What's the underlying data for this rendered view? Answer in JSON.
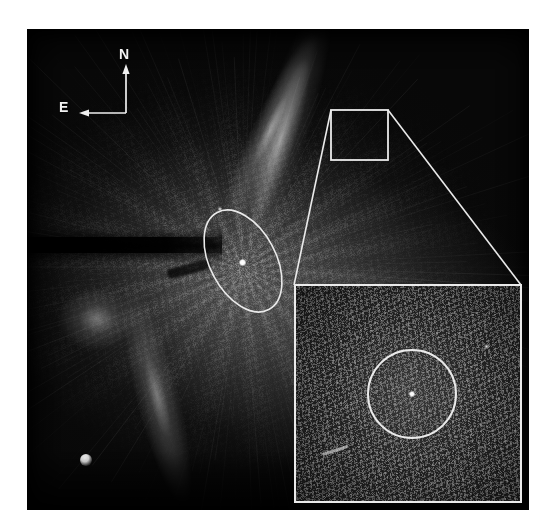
{
  "figure": {
    "type": "astronomical-coronagraph-image",
    "caption_absent": true,
    "background_color": "#ffffff",
    "plate_color": "#080808",
    "annotation_color": "#eaeaea"
  },
  "compass": {
    "north_label": "N",
    "east_label": "E",
    "north_arrow_direction": "up",
    "east_arrow_direction": "left",
    "origin_x": 99,
    "origin_y": 103,
    "stem_length_px": 45
  },
  "main_image": {
    "frame": {
      "x": 27,
      "y": 29,
      "width": 502,
      "height": 481
    },
    "features": [
      {
        "name": "central-point-source",
        "kind": "point",
        "x": 215,
        "y": 233,
        "brightness": "bright"
      },
      {
        "name": "ne-bright-arc",
        "kind": "diffuse-filament",
        "position": "upper-right-of-center"
      },
      {
        "name": "sw-bright-arc",
        "kind": "diffuse-filament",
        "position": "lower-left-of-center"
      },
      {
        "name": "west-bright-blob",
        "kind": "diffuse-knot",
        "position": "mid-left"
      },
      {
        "name": "occulting-bar",
        "kind": "mask",
        "orientation": "horizontal",
        "y": 216
      },
      {
        "name": "dark-streak",
        "kind": "mask-artifact",
        "orientation": "diagonal"
      },
      {
        "name": "sw-bright-point",
        "kind": "point",
        "x": 86,
        "y": 460
      },
      {
        "name": "faint-star",
        "kind": "point",
        "x": 218,
        "y": 209
      }
    ]
  },
  "overlays": {
    "ellipse": {
      "label": "companion-search-ellipse",
      "center_x": 216,
      "center_y": 232,
      "radius_x": 33,
      "radius_y": 55,
      "rotation_deg": -28,
      "stroke": "#eaeaea",
      "stroke_width": 1.6
    },
    "zoom_box": {
      "label": "zoom-source-box",
      "x": 304,
      "y": 81,
      "width": 57,
      "height": 50,
      "stroke": "#eaeaea",
      "stroke_width": 1.8
    },
    "zoom_lines": [
      {
        "label": "zoom-leader-left",
        "from_x": 304,
        "from_y": 81,
        "to_x": 267,
        "to_y": 255
      },
      {
        "label": "zoom-leader-right",
        "from_x": 361,
        "from_y": 81,
        "to_x": 495,
        "to_y": 255
      }
    ]
  },
  "inset": {
    "label": "magnified-detail-inset",
    "frame": {
      "x": 294,
      "y": 284,
      "width": 228,
      "height": 219
    },
    "border_color": "#eaeaea",
    "circle": {
      "label": "companion-marker-circle",
      "center_x": 116,
      "center_y": 108,
      "radius": 44,
      "stroke": "#eaeaea",
      "stroke_width": 2.0
    },
    "features": [
      {
        "name": "inset-point-source",
        "kind": "point",
        "x": 116,
        "y": 108,
        "brightness": "bright"
      },
      {
        "name": "inset-faint-star",
        "kind": "point",
        "x": 190,
        "y": 60
      },
      {
        "name": "inset-streak",
        "kind": "linear-artifact",
        "x": 38,
        "y": 164
      }
    ]
  }
}
